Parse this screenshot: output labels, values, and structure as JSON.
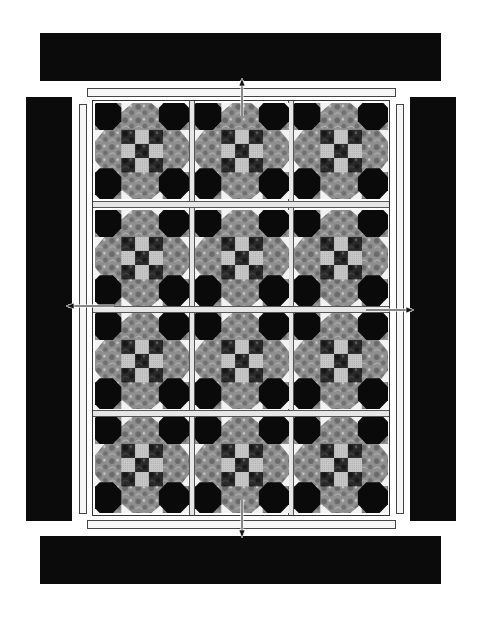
{
  "layout": {
    "rows": 4,
    "columns": 3,
    "block_pattern": "snowball-ninepatch"
  },
  "borders": {
    "top": {
      "label": "top-border"
    },
    "bottom": {
      "label": "bottom-border"
    },
    "left": {
      "label": "left-border"
    },
    "right": {
      "label": "right-border"
    }
  },
  "colors": {
    "border": "#0b0b0b",
    "sashing": "#e6e6e6",
    "strip": "#f6f6f6",
    "corner_dark": "#0a0a0a",
    "floral_mid": "#8f8f8f",
    "floral_dark": "#2a2a2a",
    "check_light": "#c8c8c8",
    "triangle_light": "#f2f2f2"
  },
  "arrows": [
    {
      "name": "arrow-up",
      "direction": "up"
    },
    {
      "name": "arrow-down",
      "direction": "down"
    },
    {
      "name": "arrow-left",
      "direction": "left"
    },
    {
      "name": "arrow-right",
      "direction": "right"
    }
  ]
}
